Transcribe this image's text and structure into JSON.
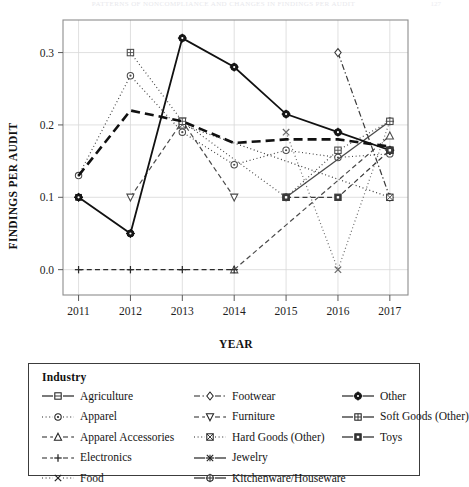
{
  "running_head": {
    "text": "PATTERNS OF NONCOMPLIANCE AND CHANGES IN FINDINGS PER AUDIT",
    "page_number": "127"
  },
  "chart_data": {
    "type": "line",
    "title": "",
    "xlabel": "YEAR",
    "ylabel": "FINDINGS PER AUDIT",
    "x": [
      2011,
      2012,
      2013,
      2014,
      2015,
      2016,
      2017
    ],
    "categories": [
      "2011",
      "2012",
      "2013",
      "2014",
      "2015",
      "2016",
      "2017"
    ],
    "xlim": [
      2010.7,
      2017.35
    ],
    "ylim": [
      -0.035,
      0.345
    ],
    "yticks": [
      0.0,
      0.1,
      0.2,
      0.3
    ],
    "ytick_labels": [
      "0.0",
      "0.1",
      "0.2",
      "0.3"
    ],
    "xticks": [
      2011,
      2012,
      2013,
      2014,
      2015,
      2016,
      2017
    ],
    "xtick_labels": [
      "2011",
      "2012",
      "2013",
      "2014",
      "2015",
      "2016",
      "2017"
    ],
    "grid": true,
    "grid_color": "#d8d8d8",
    "legend_position": "below",
    "legend_title": "Industry",
    "series": [
      {
        "name": "Agriculture",
        "marker": "square-open",
        "dash": "solid",
        "width": 1.2,
        "color": "#2b2b2b",
        "x": [
          2017
        ],
        "values": [
          0.165
        ]
      },
      {
        "name": "Apparel",
        "marker": "circle-dot",
        "dash": "dotted",
        "width": 1.2,
        "color": "#4a4a4a",
        "x": [
          2011,
          2012,
          2013,
          2014,
          2015,
          2016,
          2017
        ],
        "values": [
          0.13,
          0.268,
          0.19,
          0.145,
          0.165,
          0.155,
          0.16
        ]
      },
      {
        "name": "Apparel Accessories",
        "marker": "triangle-open",
        "dash": "dashed",
        "width": 1.2,
        "color": "#4a4a4a",
        "x": [
          2014,
          2017
        ],
        "values": [
          0.0,
          0.185
        ]
      },
      {
        "name": "Electronics",
        "marker": "plus",
        "dash": "dashed",
        "width": 1.3,
        "color": "#2b2b2b",
        "x": [
          2011,
          2012,
          2013,
          2014
        ],
        "values": [
          0.0,
          0.0,
          0.0,
          0.0
        ]
      },
      {
        "name": "Food",
        "marker": "cross",
        "dash": "dotted",
        "width": 1.2,
        "color": "#6a6a6a",
        "x": [
          2015,
          2016,
          2017
        ],
        "values": [
          0.19,
          0.0,
          0.205
        ]
      },
      {
        "name": "Footwear",
        "marker": "diamond-open",
        "dash": "dashdot",
        "width": 1.2,
        "color": "#3a3a3a",
        "x": [
          2016,
          2017
        ],
        "values": [
          0.3,
          0.1
        ]
      },
      {
        "name": "Furniture",
        "marker": "triangle-down",
        "dash": "dashed",
        "width": 1.2,
        "color": "#4a4a4a",
        "x": [
          2012,
          2013,
          2014
        ],
        "values": [
          0.1,
          0.205,
          0.1
        ]
      },
      {
        "name": "Hard Goods (Other)",
        "marker": "square-x",
        "dash": "dotted",
        "width": 1.2,
        "color": "#3a3a3a",
        "x": [
          2013,
          2017
        ],
        "values": [
          0.2,
          0.1
        ]
      },
      {
        "name": "Jewelry",
        "marker": "asterisk",
        "dash": "solid",
        "width": 1.2,
        "color": "#2b2b2b",
        "x": [
          2011
        ],
        "values": [
          0.1
        ]
      },
      {
        "name": "Kitchenware/Houseware",
        "marker": "circle-plus",
        "dash": "solid",
        "width": 1.3,
        "color": "#4a4a4a",
        "x": [
          2015,
          2017
        ],
        "values": [
          0.1,
          0.205
        ]
      },
      {
        "name": "Other",
        "marker": "circle-plus-filled",
        "dash": "solid",
        "width": 1.8,
        "color": "#111111",
        "x": [
          2011,
          2012,
          2013,
          2014,
          2015,
          2016,
          2017
        ],
        "values": [
          0.1,
          0.05,
          0.32,
          0.28,
          0.215,
          0.19,
          0.165
        ]
      },
      {
        "name": "Soft Goods (Other)",
        "marker": "square-grid",
        "dash": "dotted",
        "width": 1.2,
        "color": "#4a4a4a",
        "x": [
          2012,
          2013,
          2015,
          2016,
          2017
        ],
        "values": [
          0.3,
          0.205,
          0.1,
          0.165,
          0.205
        ]
      },
      {
        "name": "Toys",
        "marker": "square-filled",
        "dash": "dashed",
        "width": 1.2,
        "color": "#3a3a3a",
        "x": [
          2015,
          2016,
          2017
        ],
        "values": [
          0.1,
          0.1,
          0.165
        ]
      }
    ],
    "bold_dashed_overlay": {
      "name": "Food",
      "x": [
        2011,
        2012,
        2013,
        2014,
        2015,
        2016,
        2017
      ],
      "values": [
        0.13,
        0.22,
        0.205,
        0.175,
        0.18,
        0.18,
        0.17
      ]
    }
  },
  "legend": {
    "title": "Industry",
    "columns": [
      [
        {
          "label": "Agriculture",
          "key": "square-open",
          "dash": "solid"
        },
        {
          "label": "Apparel",
          "key": "circle-dot",
          "dash": "dotted"
        },
        {
          "label": "Apparel Accessories",
          "key": "triangle-open",
          "dash": "dashed"
        },
        {
          "label": "Electronics",
          "key": "plus",
          "dash": "dashed"
        },
        {
          "label": "Food",
          "key": "cross",
          "dash": "dotted"
        }
      ],
      [
        {
          "label": "Footwear",
          "key": "diamond-open",
          "dash": "dashdot"
        },
        {
          "label": "Furniture",
          "key": "triangle-down",
          "dash": "dashed"
        },
        {
          "label": "Hard Goods (Other)",
          "key": "square-x",
          "dash": "dotted"
        },
        {
          "label": "Jewelry",
          "key": "asterisk",
          "dash": "solid"
        },
        {
          "label": "Kitchenware/Houseware",
          "key": "circle-plus",
          "dash": "solid"
        }
      ],
      [
        {
          "label": "Other",
          "key": "circle-plus-filled",
          "dash": "solid"
        },
        {
          "label": "Soft Goods (Other)",
          "key": "square-grid",
          "dash": "solid"
        },
        {
          "label": "Toys",
          "key": "square-filled",
          "dash": "solid"
        }
      ]
    ]
  }
}
